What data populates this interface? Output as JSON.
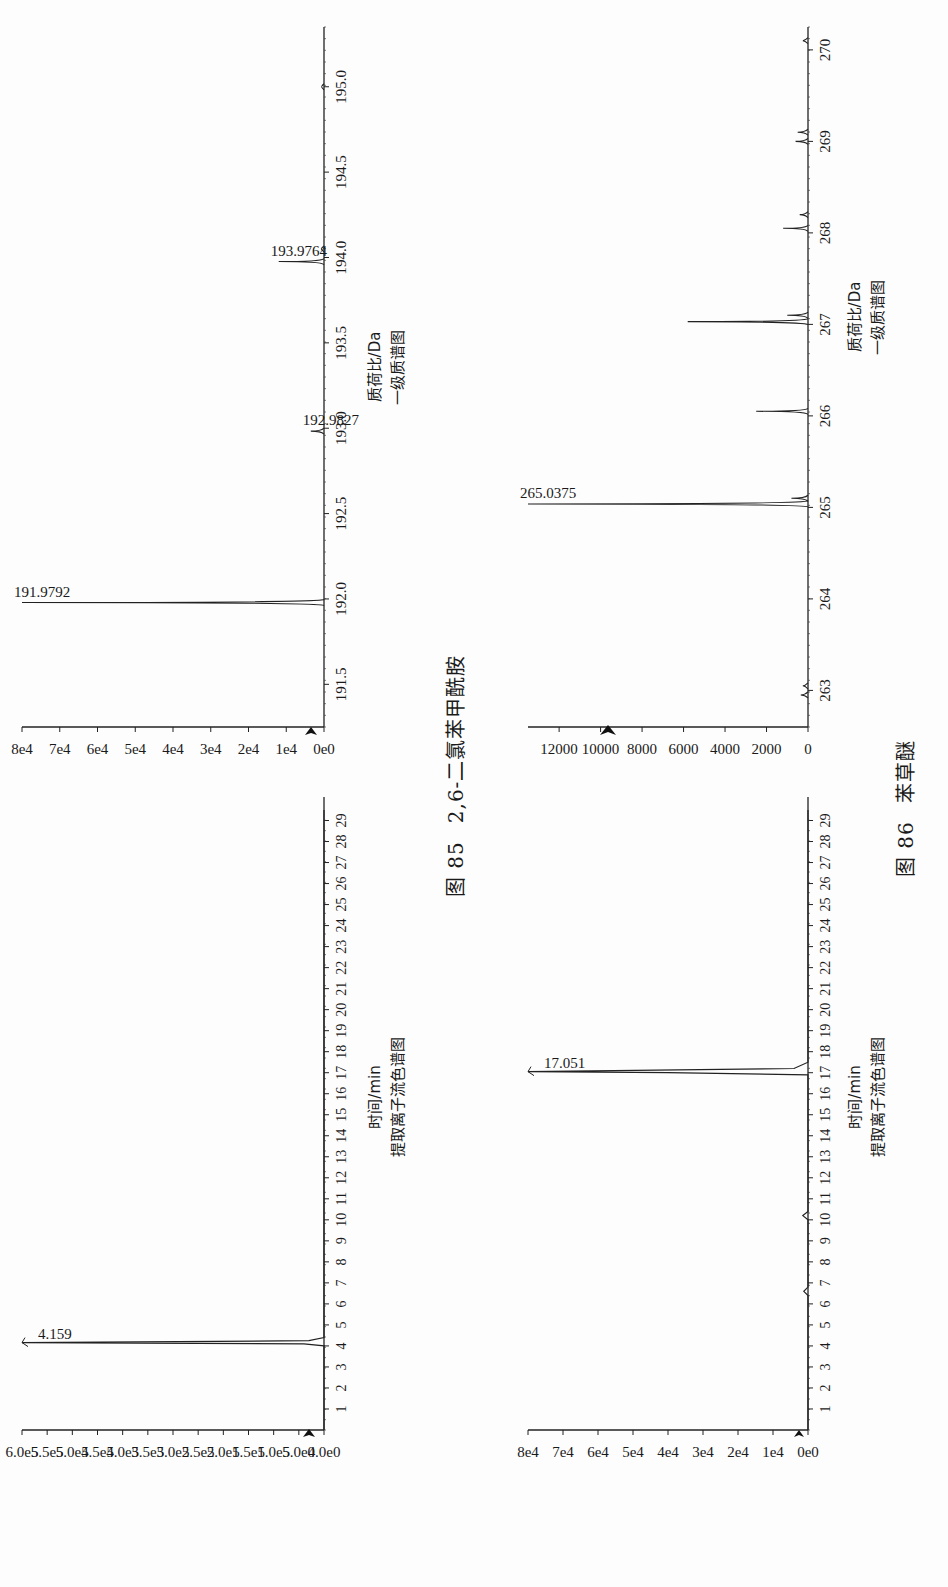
{
  "figures": [
    {
      "number": "图 85",
      "title": "2,6-二氯苯甲酰胺",
      "chromatogram": {
        "xlabel": "时间/min",
        "subtitle": "提取离子流色谱图",
        "peak_label": "4.159"
      },
      "mass_spectrum": {
        "xlabel": "质荷比/Da",
        "subtitle": "一级质谱图",
        "peak_labels": [
          "191.9792",
          "192.9827",
          "193.9764"
        ]
      }
    },
    {
      "number": "图 86",
      "title": "苯草醚",
      "chromatogram": {
        "xlabel": "时间/min",
        "subtitle": "提取离子流色谱图",
        "peak_label": "17.051"
      },
      "mass_spectrum": {
        "xlabel": "质荷比/Da",
        "subtitle": "一级质谱图",
        "peak_labels": [
          "265.0375"
        ]
      }
    }
  ],
  "chart_data": [
    {
      "type": "line",
      "figure": "图 85",
      "title": "提取离子流色谱图",
      "xlabel": "时间/min",
      "ylabel": "",
      "x_ticks": [
        "1",
        "2",
        "3",
        "4",
        "5",
        "6",
        "7",
        "8",
        "9",
        "10",
        "11",
        "12",
        "13",
        "14",
        "15",
        "16",
        "17",
        "18",
        "19",
        "20",
        "21",
        "22",
        "23",
        "24",
        "25",
        "26",
        "27",
        "28",
        "29"
      ],
      "y_ticks": [
        "0.0e0",
        "5.0e4",
        "1.0e5",
        "1.5e5",
        "2.0e5",
        "2.5e5",
        "3.0e5",
        "3.5e5",
        "4.0e5",
        "4.5e5",
        "5.0e5",
        "5.5e5",
        "6.0e5"
      ],
      "xlim": [
        0,
        29.5
      ],
      "ylim": [
        0,
        600000
      ],
      "grid": false,
      "series": [
        {
          "name": "EIC",
          "x": [
            0,
            4.0,
            4.1,
            4.159,
            4.25,
            4.4,
            29.5
          ],
          "y": [
            0,
            0,
            40000,
            600000,
            30000,
            0,
            0
          ]
        }
      ],
      "annotations": [
        {
          "x": 4.159,
          "y": 600000,
          "text": "4.159"
        }
      ]
    },
    {
      "type": "bar",
      "figure": "图 85",
      "title": "一级质谱图",
      "xlabel": "质荷比/Da",
      "ylabel": "",
      "x_ticks": [
        "191.5",
        "192.0",
        "192.5",
        "193.0",
        "193.5",
        "194.0",
        "194.5",
        "195.0"
      ],
      "y_ticks": [
        "0e0",
        "1e4",
        "2e4",
        "3e4",
        "4e4",
        "5e4",
        "6e4",
        "7e4",
        "8e4"
      ],
      "xlim": [
        191.25,
        195.35
      ],
      "ylim": [
        0,
        80000
      ],
      "grid": false,
      "categories": [
        "191.9792",
        "192.9827",
        "193.9764",
        "194.05",
        "195.0"
      ],
      "values": [
        80000,
        3500,
        12000,
        800,
        600
      ],
      "annotations": [
        {
          "x": 191.9792,
          "y": 80000,
          "text": "191.9792"
        },
        {
          "x": 192.9827,
          "y": 3500,
          "text": "192.9827"
        },
        {
          "x": 193.9764,
          "y": 12000,
          "text": "193.9764"
        }
      ]
    },
    {
      "type": "line",
      "figure": "图 86",
      "title": "提取离子流色谱图",
      "xlabel": "时间/min",
      "ylabel": "",
      "x_ticks": [
        "1",
        "2",
        "3",
        "4",
        "5",
        "6",
        "7",
        "8",
        "9",
        "10",
        "11",
        "12",
        "13",
        "14",
        "15",
        "16",
        "17",
        "18",
        "19",
        "20",
        "21",
        "22",
        "23",
        "24",
        "25",
        "26",
        "27",
        "28",
        "29"
      ],
      "y_ticks": [
        "0e0",
        "1e4",
        "2e4",
        "3e4",
        "4e4",
        "5e4",
        "6e4",
        "7e4",
        "8e4"
      ],
      "xlim": [
        0,
        29.5
      ],
      "ylim": [
        0,
        80000
      ],
      "grid": false,
      "series": [
        {
          "name": "EIC",
          "x": [
            0,
            6.4,
            6.6,
            6.8,
            10.0,
            10.2,
            10.4,
            16.9,
            17.0,
            17.051,
            17.2,
            17.5,
            29.5
          ],
          "y": [
            0,
            0,
            1200,
            0,
            0,
            1500,
            0,
            0,
            40000,
            80000,
            4000,
            0,
            0
          ]
        }
      ],
      "annotations": [
        {
          "x": 17.051,
          "y": 80000,
          "text": "17.051"
        }
      ]
    },
    {
      "type": "bar",
      "figure": "图 86",
      "title": "一级质谱图",
      "xlabel": "质荷比/Da",
      "ylabel": "",
      "x_ticks": [
        "263",
        "264",
        "265",
        "266",
        "267",
        "268",
        "269",
        "270"
      ],
      "y_ticks": [
        "0",
        "2000",
        "4000",
        "6000",
        "8000",
        "10000",
        "12000"
      ],
      "xlim": [
        262.6,
        270.25
      ],
      "ylim": [
        0,
        13500
      ],
      "grid": false,
      "categories": [
        "262.95",
        "263.05",
        "265.0375",
        "265.1",
        "266.05",
        "267.03",
        "267.1",
        "268.05",
        "268.2",
        "269.0",
        "269.1",
        "270.1"
      ],
      "values": [
        350,
        250,
        13500,
        800,
        2500,
        5800,
        1000,
        1200,
        400,
        600,
        500,
        250
      ],
      "annotations": [
        {
          "x": 265.0375,
          "y": 13500,
          "text": "265.0375"
        }
      ]
    }
  ]
}
